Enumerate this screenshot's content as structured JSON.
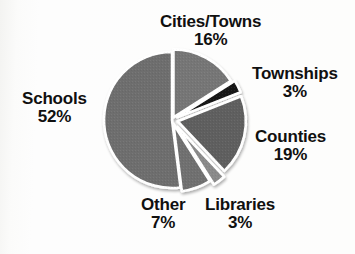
{
  "chart_data": {
    "type": "pie",
    "title": "",
    "categories": [
      "Schools",
      "Cities/Towns",
      "Townships",
      "Counties",
      "Libraries",
      "Other"
    ],
    "values": [
      52,
      16,
      3,
      19,
      3,
      7
    ],
    "value_suffix": "%",
    "legend_position": "none",
    "labels_outside": true,
    "slice_colors": [
      "#6e6e6e",
      "#767676",
      "#121212",
      "#5f5f5f",
      "#8a8a8a",
      "#707070"
    ],
    "separator_color": "#ffffff",
    "exploded": [
      "Cities/Towns",
      "Townships",
      "Counties",
      "Libraries",
      "Other"
    ],
    "slices": [
      {
        "name": "Schools",
        "percent": 52,
        "percent_text": "52%",
        "color": "#6e6e6e"
      },
      {
        "name": "Cities/Towns",
        "percent": 16,
        "percent_text": "16%",
        "color": "#767676"
      },
      {
        "name": "Townships",
        "percent": 3,
        "percent_text": "3%",
        "color": "#121212"
      },
      {
        "name": "Counties",
        "percent": 19,
        "percent_text": "19%",
        "color": "#5f5f5f"
      },
      {
        "name": "Libraries",
        "percent": 3,
        "percent_text": "3%",
        "color": "#8a8a8a"
      },
      {
        "name": "Other",
        "percent": 7,
        "percent_text": "7%",
        "color": "#707070"
      }
    ]
  },
  "labels": {
    "cities": {
      "name": "Cities/Towns",
      "pct": "16%"
    },
    "townships": {
      "name": "Townships",
      "pct": "3%"
    },
    "counties": {
      "name": "Counties",
      "pct": "19%"
    },
    "schools": {
      "name": "Schools",
      "pct": "52%"
    },
    "other": {
      "name": "Other",
      "pct": "7%"
    },
    "libraries": {
      "name": "Libraries",
      "pct": "3%"
    }
  },
  "margin_fragments": [
    {
      "text": "e",
      "top": 6
    },
    {
      "text": "a",
      "top": 62
    },
    {
      "text": "y",
      "top": 84
    },
    {
      "text": "c",
      "top": 118
    },
    {
      "text": "r",
      "top": 146
    },
    {
      "text": "e",
      "top": 182
    },
    {
      "text": "l",
      "top": 216
    }
  ]
}
